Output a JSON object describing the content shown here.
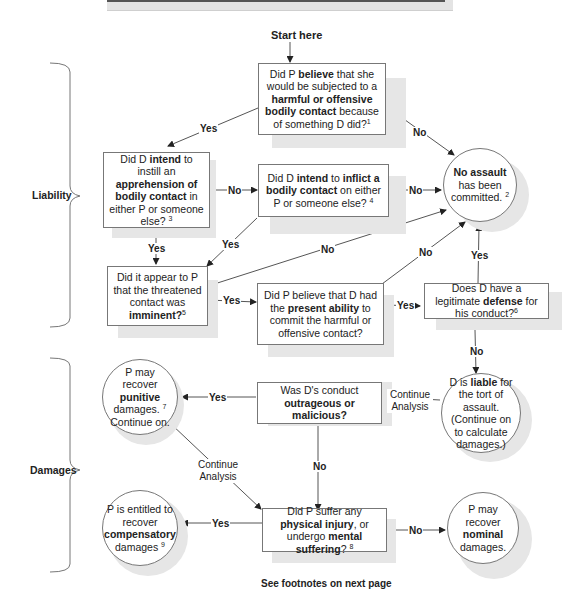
{
  "start_label": "Start here",
  "sections": {
    "liability": "Liability",
    "damages": "Damages"
  },
  "nodes": {
    "q1": {
      "pre": "Did P ",
      "b1": "believe",
      "mid1": " that she would be subjected to a ",
      "b2": "harmful or offensive bodily contact",
      "post": " because of something D did?",
      "fn": "1"
    },
    "q2": {
      "pre": "Did D ",
      "b1": "intend",
      "mid1": " to instill an ",
      "b2": "apprehension of bodily contact",
      "post": " in either P or someone else? ",
      "fn": "3"
    },
    "q3": {
      "pre": "Did D ",
      "b1": "intend",
      "mid1": " to ",
      "b2": "inflict a bodily contact",
      "post": " on either P or someone else? ",
      "fn": "4"
    },
    "q4": {
      "pre": "Did it appear to P that the threatened contact was ",
      "b1": "imminent?",
      "fn": "5"
    },
    "q5": {
      "pre": "Did P believe that D had the ",
      "b1": "present ability",
      "post": " to commit the harmful or offensive contact?"
    },
    "q6": {
      "pre": "Does D have a legitimate ",
      "b1": "defense",
      "post": " for his conduct?",
      "fn": "6"
    },
    "q7": {
      "pre": "Was D's conduct ",
      "b1": "outrageous or malicious?"
    },
    "q8": {
      "pre": "Did P suffer any ",
      "b1": "physical injury",
      "mid1": ", or undergo ",
      "b2": "mental suffering",
      "post": "? ",
      "fn": "8"
    },
    "no_assault": {
      "b1": "No assault",
      "post": " has been committed. ",
      "fn": "2"
    },
    "liable": {
      "pre": "D is ",
      "b1": "liable",
      "post": " for the tort of assault. (Continue on to calculate damages.)"
    },
    "punitive": {
      "pre": "P may recover ",
      "b1": "punitive",
      "post": " damages. ",
      "fn": "7",
      "post2": " Continue on."
    },
    "compensatory": {
      "pre": "P is entitled to recover ",
      "b1": "compensatory",
      "post": " damages ",
      "fn": "9"
    },
    "nominal": {
      "pre": "P may recover ",
      "b1": "nominal",
      "post": " damages."
    }
  },
  "edge_labels": {
    "yes": "Yes",
    "no": "No",
    "continue_analysis": "Continue Analysis"
  },
  "footer": "See footnotes on next page",
  "colors": {
    "line": "#444444",
    "shadow": "#e6e6e6",
    "border": "#777777"
  }
}
